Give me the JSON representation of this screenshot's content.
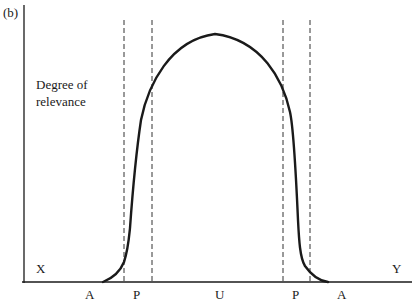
{
  "figure": {
    "panel_label": "(b)",
    "y_axis_label_line1": "Degree of",
    "y_axis_label_line2": "relevance",
    "x_axis_left_end": "X",
    "x_axis_right_end": "Y",
    "region_labels": [
      {
        "id": "A-left",
        "text": "A"
      },
      {
        "id": "P-left",
        "text": "P"
      },
      {
        "id": "U",
        "text": "U"
      },
      {
        "id": "P-right",
        "text": "P"
      },
      {
        "id": "A-right",
        "text": "A"
      }
    ],
    "dashed_boundaries_x": [
      124,
      152,
      283,
      310
    ],
    "curve": "bell-shaped (plateau) relevance curve rising from A through P to a maximum over U, then falling through P back to A",
    "colors": {
      "ink": "#1a1a1a",
      "background": "#ffffff"
    }
  }
}
